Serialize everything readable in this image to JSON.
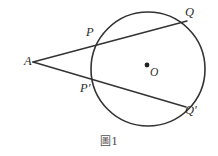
{
  "figure": {
    "caption_symbol": "圖",
    "caption_number": "1",
    "caption_full": "圖 1",
    "background_color": "#ffffff",
    "stroke_color": "#333333",
    "label_color": "#2b2b2b"
  },
  "labels": {
    "A": "A",
    "P": "P",
    "P_prime": "P'",
    "Q": "Q",
    "Q_prime": "Q'",
    "O": "O"
  },
  "chart_data": {
    "type": "diagram",
    "circle": {
      "center": {
        "x": 148,
        "y": 69,
        "label": "O"
      },
      "radius": 57,
      "stroke": "#333333",
      "stroke_width": 1.6,
      "fill": "none"
    },
    "center_dot": {
      "x": 147,
      "y": 65,
      "r": 2.4,
      "fill": "#222222"
    },
    "points": [
      {
        "label": "A",
        "x": 33,
        "y": 62,
        "position": "exterior"
      },
      {
        "label": "P",
        "x": 100,
        "y": 41,
        "position": "on-circle"
      },
      {
        "label": "Q",
        "x": 187,
        "y": 21,
        "position": "on-circle"
      },
      {
        "label": "P'",
        "x": 97,
        "y": 83,
        "position": "on-circle"
      },
      {
        "label": "Q'",
        "x": 186,
        "y": 107,
        "position": "on-circle"
      },
      {
        "label": "O",
        "x": 147,
        "y": 65,
        "position": "center"
      }
    ],
    "lines": [
      {
        "name": "secant-APQ",
        "from": "A",
        "through": "P",
        "to": "Q",
        "x1": 33,
        "y1": 62,
        "x2": 187,
        "y2": 21
      },
      {
        "name": "secant-APQ-pr",
        "from": "A",
        "through": "P'",
        "to": "Q'",
        "x1": 33,
        "y1": 62,
        "x2": 186,
        "y2": 107
      }
    ],
    "xlabel": "",
    "ylabel": "",
    "grid": false,
    "legend": false
  }
}
